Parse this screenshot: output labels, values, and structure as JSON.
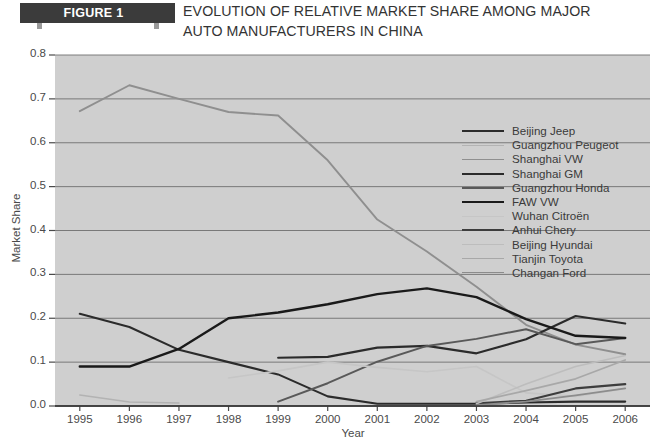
{
  "header": {
    "figure_tab": "FIGURE 1",
    "title_line1": "EVOLUTION OF RELATIVE MARKET SHARE AMONG MAJOR",
    "title_line2": "AUTO MANUFACTURERS IN CHINA"
  },
  "chart_data": {
    "type": "line",
    "title": "EVOLUTION OF RELATIVE MARKET SHARE AMONG MAJOR AUTO MANUFACTURERS IN CHINA",
    "xlabel": "Year",
    "ylabel": "Market Share",
    "x": [
      1995,
      1996,
      1997,
      1998,
      1999,
      2000,
      2001,
      2002,
      2003,
      2004,
      2005,
      2006
    ],
    "xtick_labels": [
      "1995",
      "1996",
      "1997",
      "1998",
      "1999",
      "2000",
      "2001",
      "2002",
      "2003",
      "2004",
      "2005",
      "2006"
    ],
    "ytick_labels": [
      "0.0",
      "0.1",
      "0.2",
      "0.3",
      "0.4",
      "0.5",
      "0.6",
      "0.7",
      "0.8"
    ],
    "ylim": [
      0.0,
      0.8
    ],
    "ytick_step": 0.1,
    "grid": "horizontal",
    "legend_position": "upper-right",
    "plot_background": "#cfcfcf",
    "series": [
      {
        "name": "Beijing Jeep",
        "color": "#2b2b2b",
        "width": 2.1,
        "values": [
          0.21,
          0.18,
          0.128,
          0.1,
          0.072,
          0.022,
          0.005,
          0.005,
          0.005,
          0.008,
          0.01,
          0.01
        ]
      },
      {
        "name": "Guangzhou Peugeot",
        "color": "#b3b3b3",
        "width": 1.5,
        "values": [
          0.025,
          0.009,
          0.007,
          null,
          null,
          null,
          null,
          null,
          null,
          null,
          null,
          null
        ]
      },
      {
        "name": "Shanghai VW",
        "color": "#8f8f8f",
        "width": 1.9,
        "values": [
          0.672,
          0.731,
          0.7,
          0.67,
          0.662,
          0.56,
          0.425,
          0.352,
          0.272,
          0.185,
          0.14,
          0.118
        ]
      },
      {
        "name": "Shanghai GM",
        "color": "#2b2b2b",
        "width": 2.1,
        "values": [
          null,
          null,
          null,
          null,
          0.11,
          0.112,
          0.133,
          0.137,
          0.12,
          0.152,
          0.205,
          0.188
        ]
      },
      {
        "name": "Guangzhou Honda",
        "color": "#595959",
        "width": 2.0,
        "values": [
          null,
          null,
          null,
          null,
          0.01,
          0.052,
          0.101,
          0.137,
          0.153,
          0.175,
          0.141,
          0.155
        ]
      },
      {
        "name": "FAW VW",
        "color": "#1a1a1a",
        "width": 2.4,
        "values": [
          0.09,
          0.09,
          0.13,
          0.2,
          0.213,
          0.232,
          0.255,
          0.268,
          0.248,
          0.198,
          0.16,
          0.155
        ]
      },
      {
        "name": "Wuhan Citroën",
        "color": "#c6c6c6",
        "width": 1.6,
        "values": [
          null,
          null,
          null,
          0.064,
          0.08,
          0.1,
          0.088,
          0.078,
          0.09,
          0.03,
          0.022,
          0.04
        ]
      },
      {
        "name": "Anhui Chery",
        "color": "#3d3d3d",
        "width": 2.2,
        "values": [
          null,
          null,
          null,
          null,
          null,
          null,
          null,
          null,
          0.006,
          0.012,
          0.04,
          0.05
        ]
      },
      {
        "name": "Beijing Hyundai",
        "color": "#bdbdbd",
        "width": 1.6,
        "values": [
          null,
          null,
          null,
          null,
          null,
          null,
          null,
          null,
          0.005,
          0.05,
          0.09,
          0.115
        ]
      },
      {
        "name": "Tianjin Toyota",
        "color": "#a8a8a8",
        "width": 1.7,
        "values": [
          null,
          null,
          null,
          null,
          null,
          null,
          null,
          null,
          0.01,
          0.035,
          0.062,
          0.105
        ]
      },
      {
        "name": "Changan Ford",
        "color": "#8c8c8c",
        "width": 1.8,
        "values": [
          null,
          null,
          null,
          null,
          null,
          null,
          null,
          null,
          0.002,
          0.01,
          0.024,
          0.04
        ]
      }
    ]
  }
}
